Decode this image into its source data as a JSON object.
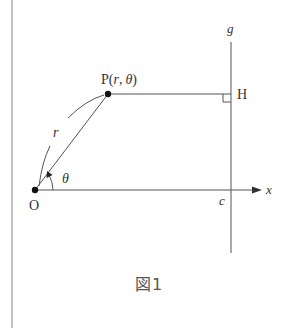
{
  "figure": {
    "caption": "図1",
    "caption_kanji": "図",
    "caption_number": "1"
  },
  "labels": {
    "point_p": "P",
    "point_p_coords_open": "(",
    "point_p_r": "r",
    "point_p_comma": ",",
    "point_p_theta": "θ",
    "point_p_coords_close": ")",
    "point_h": "H",
    "origin": "O",
    "line_g": "g",
    "axis_x": "x",
    "intercept_c": "c",
    "radius_r": "r",
    "angle_theta": "θ"
  },
  "geometry": {
    "origin": [
      35,
      190
    ],
    "point_p": [
      108,
      94
    ],
    "point_h": [
      231,
      94
    ],
    "line_g_x": 231,
    "line_g_y_range": [
      42,
      253
    ],
    "x_axis_y": 190,
    "x_axis_end": 262,
    "left_border_x": 12
  },
  "colors": {
    "line": "#555555",
    "point": "#111111",
    "text": "#333333"
  }
}
